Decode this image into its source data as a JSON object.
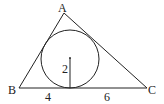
{
  "figure": {
    "vertices": {
      "A": "A",
      "B": "B",
      "C": "C"
    },
    "labels": {
      "radius": "2",
      "segment_left": "4",
      "segment_right": "6"
    },
    "values": {
      "radius": 2,
      "segment_left": 4,
      "segment_right": 6
    },
    "colors": {
      "stroke": "#222222",
      "background": "#ffffff"
    }
  }
}
